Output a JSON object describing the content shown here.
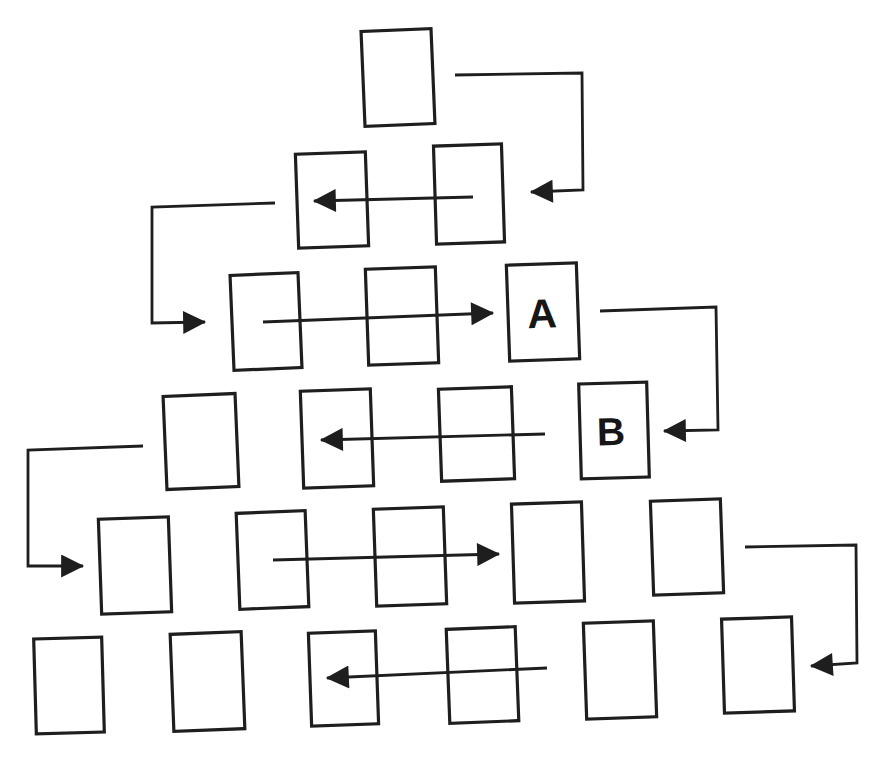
{
  "figure": {
    "type": "pyramid-serpentine-traversal-diagram",
    "background_color": "#ffffff",
    "ink_color": "#1e1e1e",
    "rows": [
      {
        "row": 1,
        "box_count": 1,
        "labeled_boxes": []
      },
      {
        "row": 2,
        "box_count": 2,
        "labeled_boxes": []
      },
      {
        "row": 3,
        "box_count": 3,
        "labeled_boxes": [
          {
            "position": 3,
            "label": "A"
          }
        ]
      },
      {
        "row": 4,
        "box_count": 4,
        "labeled_boxes": [
          {
            "position": 4,
            "label": "B"
          }
        ]
      },
      {
        "row": 5,
        "box_count": 5,
        "labeled_boxes": []
      },
      {
        "row": 6,
        "box_count": 6,
        "labeled_boxes": []
      }
    ],
    "labels": {
      "a": "A",
      "b": "B"
    },
    "arrows": [
      {
        "id": 1,
        "from": "row1-box1",
        "to": "row2-box2",
        "shape": "right-then-down-then-left"
      },
      {
        "id": 2,
        "from": "row2-box2",
        "to": "row2-box1",
        "shape": "straight-left"
      },
      {
        "id": 3,
        "from": "row2-box1",
        "to": "row3-box1",
        "shape": "left-then-down-then-right"
      },
      {
        "id": 4,
        "from": "row3-box1",
        "to": "row3-box3-A",
        "shape": "straight-right"
      },
      {
        "id": 5,
        "from": "row3-box3-A",
        "to": "row4-box4-B",
        "shape": "right-then-down-then-left"
      },
      {
        "id": 6,
        "from": "row4-box4-B",
        "to": "row4-box2",
        "shape": "straight-left"
      },
      {
        "id": 7,
        "from": "row4-box1",
        "to": "row5-box1",
        "shape": "left-then-down-then-right"
      },
      {
        "id": 8,
        "from": "row5-box2",
        "to": "row5-box4",
        "shape": "straight-right"
      },
      {
        "id": 9,
        "from": "row5-box5",
        "to": "row6-box6",
        "shape": "right-then-down-then-left"
      },
      {
        "id": 10,
        "from": "row6-box4",
        "to": "row6-box3",
        "shape": "straight-left"
      }
    ]
  }
}
